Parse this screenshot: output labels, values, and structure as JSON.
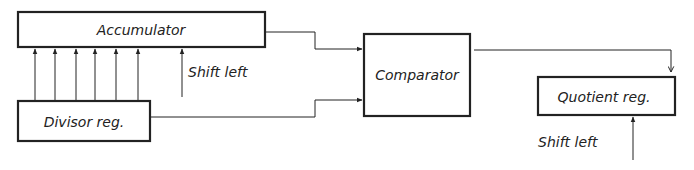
{
  "diagram": {
    "blocks": {
      "accumulator": {
        "label": "Accumulator"
      },
      "divisor_reg": {
        "label": "Divisor reg."
      },
      "comparator": {
        "label": "Comparator"
      },
      "quotient_reg": {
        "label": "Quotient reg."
      }
    },
    "annotations": {
      "accumulator_shift": "Shift left",
      "quotient_shift": "Shift left"
    },
    "colors": {
      "ink": "#222222",
      "background": "#ffffff"
    }
  }
}
